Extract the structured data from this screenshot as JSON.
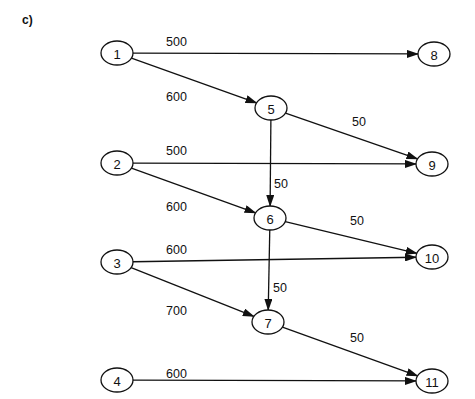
{
  "figure": {
    "panel_label": "c)"
  },
  "nodes": [
    {
      "id": "1",
      "label": "1",
      "x": 117,
      "y": 53
    },
    {
      "id": "8",
      "label": "8",
      "x": 434,
      "y": 54
    },
    {
      "id": "5",
      "label": "5",
      "x": 271,
      "y": 108
    },
    {
      "id": "9",
      "label": "9",
      "x": 432,
      "y": 164
    },
    {
      "id": "2",
      "label": "2",
      "x": 117,
      "y": 163
    },
    {
      "id": "6",
      "label": "6",
      "x": 270,
      "y": 218
    },
    {
      "id": "3",
      "label": "3",
      "x": 117,
      "y": 262
    },
    {
      "id": "10",
      "label": "10",
      "x": 432,
      "y": 257
    },
    {
      "id": "7",
      "label": "7",
      "x": 268,
      "y": 322
    },
    {
      "id": "4",
      "label": "4",
      "x": 117,
      "y": 380
    },
    {
      "id": "11",
      "label": "11",
      "x": 432,
      "y": 381
    }
  ],
  "edges": [
    {
      "from": "1",
      "to": "8",
      "weight": "500",
      "label_x": 166,
      "label_y": 46
    },
    {
      "from": "1",
      "to": "5",
      "weight": "600",
      "label_x": 166,
      "label_y": 101
    },
    {
      "from": "5",
      "to": "9",
      "weight": "50",
      "label_x": 352,
      "label_y": 126
    },
    {
      "from": "2",
      "to": "9",
      "weight": "500",
      "label_x": 166,
      "label_y": 155
    },
    {
      "from": "5",
      "to": "6",
      "weight": "50",
      "label_x": 274,
      "label_y": 188
    },
    {
      "from": "2",
      "to": "6",
      "weight": "600",
      "label_x": 166,
      "label_y": 211
    },
    {
      "from": "6",
      "to": "10",
      "weight": "50",
      "label_x": 350,
      "label_y": 225
    },
    {
      "from": "3",
      "to": "10",
      "weight": "600",
      "label_x": 166,
      "label_y": 254
    },
    {
      "from": "6",
      "to": "7",
      "weight": "50",
      "label_x": 273,
      "label_y": 292
    },
    {
      "from": "3",
      "to": "7",
      "weight": "700",
      "label_x": 166,
      "label_y": 315
    },
    {
      "from": "7",
      "to": "11",
      "weight": "50",
      "label_x": 350,
      "label_y": 342
    },
    {
      "from": "4",
      "to": "11",
      "weight": "600",
      "label_x": 166,
      "label_y": 378
    }
  ]
}
